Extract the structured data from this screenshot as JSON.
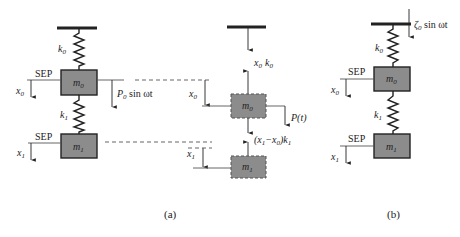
{
  "figure": {
    "panel_a": {
      "caption": "(a)",
      "left_system": {
        "spring_top": {
          "label": "k",
          "sub": "0"
        },
        "spring_mid": {
          "label": "k",
          "sub": "1"
        },
        "mass_top": {
          "label": "m",
          "sub": "0"
        },
        "mass_bottom": {
          "label": "m",
          "sub": "1"
        },
        "sep_top": "SEP",
        "sep_bottom": "SEP",
        "disp_top": {
          "label": "x",
          "sub": "0"
        },
        "disp_bottom": {
          "label": "x",
          "sub": "1"
        },
        "force": {
          "label": "P",
          "sub": "0",
          "rest": " sin ωt"
        }
      },
      "free_body": {
        "top_force": {
          "x": "x",
          "xsub": "0",
          "k": "k",
          "ksub": "0"
        },
        "mid_force": {
          "open": "(x",
          "s1": "1",
          "minus": "−x",
          "s0": "0",
          "close": ")k",
          "sk": "1"
        },
        "external_force": "P(t)",
        "mass_top": {
          "label": "m",
          "sub": "0"
        },
        "mass_bottom": {
          "label": "m",
          "sub": "1"
        },
        "disp_top": {
          "label": "x",
          "sub": "0"
        },
        "disp_bottom": {
          "label": "x",
          "sub": "1"
        }
      }
    },
    "panel_b": {
      "caption": "(b)",
      "base_excitation": {
        "label": "ζ",
        "sub": "0",
        "rest": " sin ωt"
      },
      "spring_top": {
        "label": "k",
        "sub": "0"
      },
      "spring_mid": {
        "label": "k",
        "sub": "1"
      },
      "mass_top": {
        "label": "m",
        "sub": "0"
      },
      "mass_bottom": {
        "label": "m",
        "sub": "1"
      },
      "sep_top": "SEP",
      "sep_bottom": "SEP",
      "disp_top": {
        "label": "x",
        "sub": "0"
      },
      "disp_bottom": {
        "label": "x",
        "sub": "1"
      }
    },
    "colors": {
      "mass_fill": "#8c8c8c",
      "line": "#222222"
    }
  }
}
